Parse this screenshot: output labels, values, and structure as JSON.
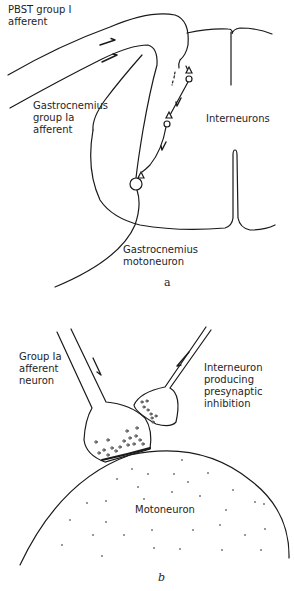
{
  "panel_a": {
    "labels": {
      "pbst": "PBST group I\nafferent",
      "gastroc_afferent": "Gastrocnemius\ngroup Ia\nafferent",
      "interneurons": "Interneurons",
      "motoneuron": "Gastrocnemius\nmotoneuron"
    },
    "caption": "a"
  },
  "panel_b": {
    "labels": {
      "group_ia": "Group Ia\nafferent\nneuron",
      "interneuron": "Interneuron\nproducing\npresynaptic\ninhibition",
      "motoneuron": "Motoneuron"
    },
    "caption": "b"
  },
  "colors": {
    "line": "#1a1a1a",
    "background": "#ffffff"
  }
}
